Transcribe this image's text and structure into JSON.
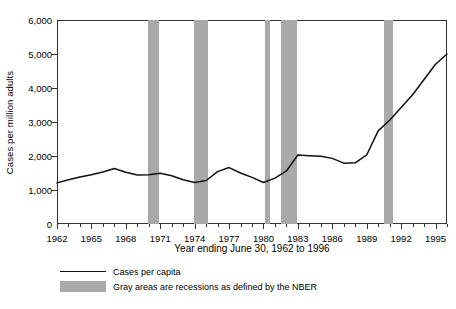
{
  "chart_data": {
    "type": "line",
    "title": "",
    "xlabel": "Year ending June 30, 1962 to 1996",
    "ylabel": "Cases per million adults",
    "xlim": [
      1962,
      1996
    ],
    "ylim": [
      0,
      6000
    ],
    "grid": false,
    "legend_position": "below-axes-left",
    "ytick_labels": [
      "0",
      "1,000",
      "2,000",
      "3,000",
      "4,000",
      "5,000",
      "6,000"
    ],
    "ytick_values": [
      0,
      1000,
      2000,
      3000,
      4000,
      5000,
      6000
    ],
    "xtick_labels": [
      "1962",
      "1965",
      "1968",
      "1971",
      "1974",
      "1977",
      "1980",
      "1983",
      "1986",
      "1989",
      "1992",
      "1995"
    ],
    "xtick_values": [
      1962,
      1965,
      1968,
      1971,
      1974,
      1977,
      1980,
      1983,
      1986,
      1989,
      1992,
      1995
    ],
    "xminor_step": 1,
    "series": [
      {
        "name": "Cases per capita",
        "color": "#111111",
        "x": [
          1962,
          1963,
          1964,
          1965,
          1966,
          1967,
          1968,
          1969,
          1970,
          1971,
          1972,
          1973,
          1974,
          1975,
          1976,
          1977,
          1978,
          1979,
          1980,
          1981,
          1982,
          1983,
          1984,
          1985,
          1986,
          1987,
          1988,
          1989,
          1990,
          1991,
          1992,
          1993,
          1994,
          1995,
          1996
        ],
        "values": [
          1210,
          1300,
          1380,
          1450,
          1530,
          1630,
          1520,
          1440,
          1450,
          1490,
          1420,
          1300,
          1220,
          1280,
          1540,
          1660,
          1500,
          1370,
          1220,
          1350,
          1560,
          2030,
          2010,
          1990,
          1930,
          1790,
          1800,
          2030,
          2740,
          3050,
          3430,
          3800,
          4250,
          4700,
          5000
        ]
      }
    ],
    "series_corrected_note": "",
    "bands": [
      {
        "label": "recession",
        "start": 1969.9,
        "end": 1970.9
      },
      {
        "label": "recession",
        "start": 1973.9,
        "end": 1975.2
      },
      {
        "label": "recession",
        "start": 1980.1,
        "end": 1980.6
      },
      {
        "label": "recession",
        "start": 1981.5,
        "end": 1982.9
      },
      {
        "label": "recession",
        "start": 1990.5,
        "end": 1991.3
      }
    ],
    "band_color": "#a9a9a9",
    "annotations": []
  },
  "legend": {
    "items": [
      {
        "key": "line",
        "label": "Cases per capita"
      },
      {
        "key": "swatch",
        "label": "Gray areas are recessions as defined by the NBER"
      }
    ]
  }
}
